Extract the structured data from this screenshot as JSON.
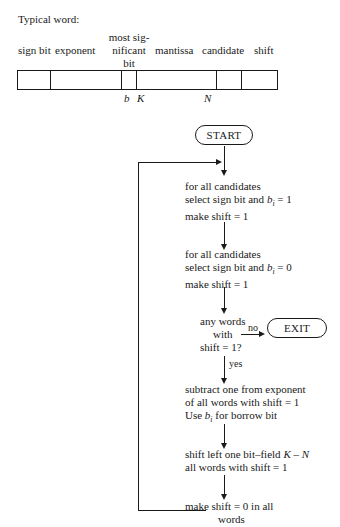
{
  "word_format": {
    "title": "Typical word:",
    "fields": [
      {
        "label": "sign bit"
      },
      {
        "label": "exponent"
      },
      {
        "label_lines": [
          "most sig-",
          "nificant",
          "bit"
        ]
      },
      {
        "label": "mantissa"
      },
      {
        "label": "candidate"
      },
      {
        "label": "shift"
      }
    ],
    "markers": {
      "b": "b",
      "K": "K",
      "N": "N"
    }
  },
  "flowchart": {
    "start": "START",
    "exit": "EXIT",
    "step1": {
      "l1": "for all candidates",
      "l2a": "select sign bit and ",
      "l2var": "b",
      "l2sub": "i",
      "l2b": " = 1",
      "l3": "make shift = 1"
    },
    "step2": {
      "l1": "for all candidates",
      "l2a": "select sign bit and ",
      "l2var": "b",
      "l2sub": "i",
      "l2b": " = 0",
      "l3": "make shift = 1"
    },
    "decision": {
      "l1": "any words",
      "l2": "with",
      "l3": "shift = 1?",
      "no": "no",
      "yes": "yes"
    },
    "step3": {
      "l1": "subtract one from exponent",
      "l2": "of all words with shift = 1",
      "l3a": "Use ",
      "l3var": "b",
      "l3sub": "i",
      "l3b": " for borrow bit"
    },
    "step4": {
      "l1a": "shift left one bit–field ",
      "l1var": "K – N",
      "l2": "all words with shift = 1"
    },
    "step5": {
      "l1": "make shift = 0 in all",
      "l2": "words"
    }
  }
}
